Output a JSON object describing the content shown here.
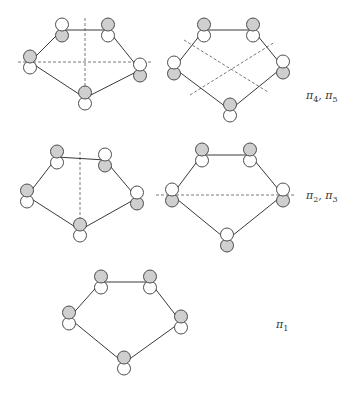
{
  "colors": {
    "filled": "#cfcfcf",
    "empty": "#ffffff",
    "line": "#3a3a3a"
  },
  "labels": {
    "row1": "π4, π5",
    "row2": "π2, π3",
    "row3": "π1"
  },
  "label_parts": {
    "row1": [
      {
        "sym": "π",
        "sub": "4"
      },
      {
        "sym": "π",
        "sub": "5"
      }
    ],
    "row2": [
      {
        "sym": "π",
        "sub": "2"
      },
      {
        "sym": "π",
        "sub": "3"
      }
    ],
    "row3": [
      {
        "sym": "π",
        "sub": "1"
      }
    ]
  },
  "diagrams": [
    {
      "id": "pi4",
      "vertices": [
        [
          62,
          30
        ],
        [
          108,
          30
        ],
        [
          140,
          70
        ],
        [
          85,
          98
        ],
        [
          30,
          62
        ]
      ],
      "lobes": [
        [
          "empty",
          "filled"
        ],
        [
          "filled",
          "empty"
        ],
        [
          "empty",
          "filled"
        ],
        null,
        [
          "filled",
          "empty"
        ]
      ],
      "nodal_planes": [
        [
          85,
          18,
          85,
          108
        ],
        [
          18,
          62,
          152,
          62
        ]
      ]
    },
    {
      "id": "pi5",
      "vertices": [
        [
          204,
          30
        ],
        [
          253,
          30
        ],
        [
          283,
          67
        ],
        [
          230,
          110
        ],
        [
          174,
          68
        ]
      ],
      "lobes": [
        [
          "filled",
          "empty"
        ],
        [
          "filled",
          "empty"
        ],
        [
          "empty",
          "filled"
        ],
        [
          "filled",
          "empty"
        ],
        [
          "empty",
          "filled"
        ]
      ],
      "nodal_planes": [
        [
          184,
          40,
          268,
          92
        ],
        [
          190,
          95,
          275,
          42
        ]
      ]
    },
    {
      "id": "pi2",
      "vertices": [
        [
          57,
          157
        ],
        [
          105,
          160
        ],
        [
          137,
          198
        ],
        [
          80,
          230
        ],
        [
          27,
          196
        ]
      ],
      "lobes": [
        [
          "filled",
          "empty"
        ],
        [
          "empty",
          "filled"
        ],
        [
          "empty",
          "filled"
        ],
        null,
        [
          "filled",
          "empty"
        ]
      ],
      "nodal_planes": [
        [
          80,
          152,
          80,
          240
        ]
      ]
    },
    {
      "id": "pi3",
      "vertices": [
        [
          202,
          155
        ],
        [
          250,
          155
        ],
        [
          283,
          195
        ],
        [
          227,
          240
        ],
        [
          172,
          195
        ]
      ],
      "lobes": [
        [
          "filled",
          "empty"
        ],
        [
          "filled",
          "empty"
        ],
        [
          "empty",
          "filled"
        ],
        [
          "empty",
          "filled"
        ],
        [
          "empty",
          "filled"
        ]
      ],
      "nodal_planes": [
        [
          156,
          195,
          296,
          195
        ]
      ]
    },
    {
      "id": "pi1",
      "vertices": [
        [
          101,
          282
        ],
        [
          150,
          282
        ],
        [
          181,
          322
        ],
        [
          124,
          363
        ],
        [
          69,
          318
        ]
      ],
      "lobes": [
        [
          "filled",
          "empty"
        ],
        [
          "filled",
          "empty"
        ],
        [
          "filled",
          "empty"
        ],
        [
          "filled",
          "empty"
        ],
        [
          "filled",
          "empty"
        ]
      ],
      "nodal_planes": []
    }
  ]
}
